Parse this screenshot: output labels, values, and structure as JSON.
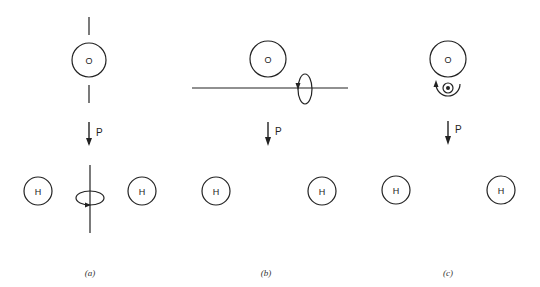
{
  "figure": {
    "panels": [
      {
        "id": "a",
        "label": "(a)",
        "atoms": {
          "top": "O",
          "left": "H",
          "right": "H"
        },
        "dipole_label": "P",
        "axis": "vertical, in molecular plane along dipole"
      },
      {
        "id": "b",
        "label": "(b)",
        "atoms": {
          "top": "O",
          "left": "H",
          "right": "H"
        },
        "dipole_label": "P",
        "axis": "horizontal, in molecular plane perpendicular to dipole"
      },
      {
        "id": "c",
        "label": "(c)",
        "atoms": {
          "top": "O",
          "left": "H",
          "right": "H"
        },
        "dipole_label": "P",
        "axis": "perpendicular to molecular plane (out of page)"
      }
    ]
  }
}
